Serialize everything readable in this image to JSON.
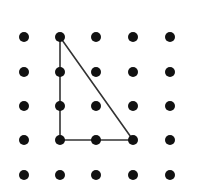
{
  "diagram": {
    "type": "dot-grid-geoboard",
    "grid": {
      "rows": 5,
      "cols": 5,
      "x_positions": [
        24,
        60,
        96,
        133,
        170
      ],
      "y_positions": [
        37,
        72,
        106,
        140,
        175
      ],
      "dot_radius": 5,
      "dot_color": "#111111"
    },
    "shape": {
      "type": "right-triangle",
      "vertices_grid": [
        [
          1,
          0
        ],
        [
          1,
          3
        ],
        [
          3,
          3
        ]
      ],
      "stroke_color": "#333333",
      "stroke_width": 1.6
    },
    "background": "#ffffff"
  }
}
